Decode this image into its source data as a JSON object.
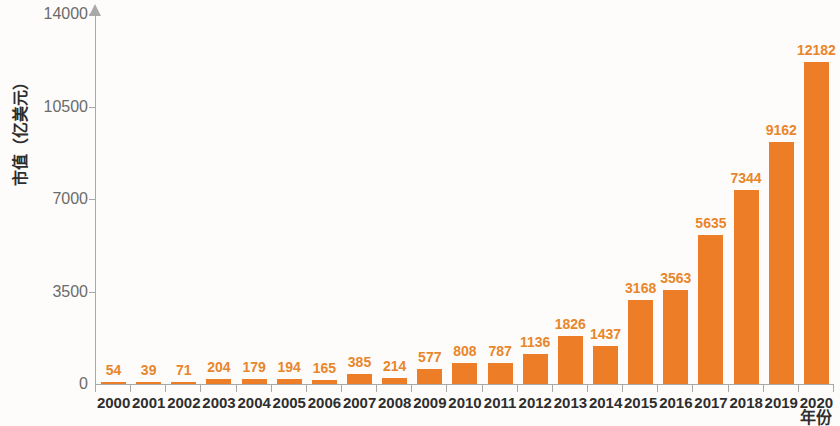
{
  "chart_data": {
    "type": "bar",
    "title": "",
    "xlabel": "年份",
    "ylabel": "市值（亿美元）",
    "categories": [
      "2000",
      "2001",
      "2002",
      "2003",
      "2004",
      "2005",
      "2006",
      "2007",
      "2008",
      "2009",
      "2010",
      "2011",
      "2012",
      "2013",
      "2014",
      "2015",
      "2016",
      "2017",
      "2018",
      "2019",
      "2020"
    ],
    "values": [
      54,
      39,
      71,
      204,
      179,
      194,
      165,
      385,
      214,
      577,
      808,
      787,
      1136,
      1826,
      1437,
      3168,
      3563,
      5635,
      7344,
      9162,
      12182
    ],
    "ylim": [
      0,
      14000
    ],
    "yticks": [
      0,
      3500,
      7000,
      10500,
      14000
    ],
    "ytick_labels": [
      "0",
      "3500",
      "7000",
      "10500",
      "14000"
    ],
    "grid": false,
    "legend": null,
    "bar_color": "#ed7d26",
    "value_label_color": "#e8862c",
    "axis_color": "#a9a9a9",
    "background": "#fdfcfa"
  }
}
